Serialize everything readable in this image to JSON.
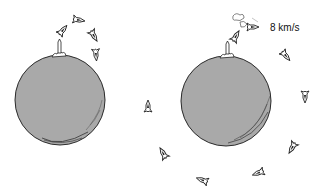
{
  "figure": {
    "speed_label": "8 km/s",
    "colors": {
      "planet_fill": "#a9a9a9",
      "planet_outline": "#2a2a2a",
      "rocket": "#222222",
      "background": "#ffffff"
    },
    "planets": [
      {
        "id": "left",
        "cx": 60,
        "cy": 100,
        "r": 45
      },
      {
        "id": "right",
        "cx": 226,
        "cy": 101,
        "r": 45
      }
    ],
    "left_rockets": [
      {
        "x": 79,
        "y": 20,
        "angle": 100
      },
      {
        "x": 63,
        "y": 30,
        "angle": 40
      },
      {
        "x": 94,
        "y": 36,
        "angle": 150
      },
      {
        "x": 96,
        "y": 55,
        "angle": 175
      },
      {
        "x": 148,
        "y": 106,
        "angle": 0
      }
    ],
    "right_rockets": [
      {
        "x": 236,
        "y": 36,
        "angle": 30
      },
      {
        "x": 253,
        "y": 27,
        "angle": 90
      },
      {
        "x": 286,
        "y": 56,
        "angle": 140
      },
      {
        "x": 305,
        "y": 97,
        "angle": 180
      },
      {
        "x": 292,
        "y": 148,
        "angle": 210
      },
      {
        "x": 258,
        "y": 173,
        "angle": 250
      },
      {
        "x": 202,
        "y": 180,
        "angle": 290
      },
      {
        "x": 163,
        "y": 153,
        "angle": 330
      }
    ]
  }
}
